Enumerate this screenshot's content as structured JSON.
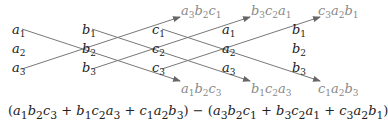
{
  "diagram": {
    "columns": [
      {
        "name": "a",
        "entries": [
          "a1",
          "a2",
          "a3"
        ]
      },
      {
        "name": "b",
        "entries": [
          "b1",
          "b2",
          "b3"
        ]
      },
      {
        "name": "c",
        "entries": [
          "c1",
          "c2",
          "c3"
        ]
      },
      {
        "name": "a",
        "entries": [
          "a1",
          "a2",
          "a3"
        ]
      },
      {
        "name": "b",
        "entries": [
          "b1",
          "b2",
          "b3"
        ]
      }
    ],
    "upper_products": [
      "a3b2c1",
      "b3c2a1",
      "c3a2b1"
    ],
    "lower_products": [
      "a1b2c3",
      "b1c2a3",
      "c1a2b3"
    ],
    "formula": "(a1b2c3 + b1c2a3 + c1a2b3) − (a3b2c1 + b3c2a1 + c3a2b1)",
    "colors": {
      "text": "#222222",
      "products": "#8a8a8a",
      "lines": "#777777"
    }
  }
}
